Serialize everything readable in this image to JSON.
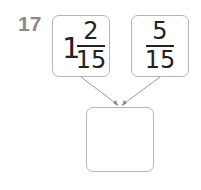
{
  "problem": {
    "number": "17",
    "operands": [
      {
        "whole": "1",
        "numerator": "2",
        "denominator": "15"
      },
      {
        "whole": "",
        "numerator": "5",
        "denominator": "15"
      }
    ],
    "answer_box": ""
  },
  "colors": {
    "border": "#b5b5b5",
    "number": "#8a8a8a",
    "text": "#222222",
    "arrow": "#9a9a9a"
  }
}
